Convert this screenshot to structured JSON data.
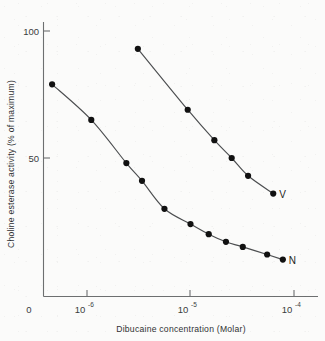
{
  "figure": {
    "background_color": "#fbfbfa",
    "ink_color": "#3a3c3e",
    "marker_color": "#111111"
  },
  "chart_data": {
    "type": "line",
    "title": "",
    "subtitle": "",
    "xlabel": "Dibucaine concentration (Molar)",
    "ylabel": "Choline esterase activity (% of maximum)",
    "x_scale": "log",
    "x_axis_origin_label": "0",
    "x_tick_labels": [
      "10⁻⁶",
      "10⁻⁵",
      "10⁻⁴"
    ],
    "x_tick_bases": [
      "10",
      "10",
      "10"
    ],
    "x_tick_exponents": [
      "-6",
      "-5",
      "-4"
    ],
    "x_tick_values": [
      1e-06,
      1e-05,
      0.0001
    ],
    "xlim": [
      3e-07,
      0.00011
    ],
    "y_tick_labels": [
      "50",
      "100"
    ],
    "y_tick_values": [
      50,
      100
    ],
    "ylim": [
      0,
      108
    ],
    "grid": false,
    "legend_position": "inline-at-curve-end",
    "annotations": [
      {
        "text": "V",
        "series": "V",
        "position": "right-end-of-upper-curve"
      },
      {
        "text": "N",
        "series": "N",
        "position": "right-end-of-lower-curve"
      }
    ],
    "series": [
      {
        "name": "V",
        "label": "V",
        "marker": "filled-circle",
        "color": "#111111",
        "x": [
          3.1e-06,
          9.4e-06,
          1.7e-05,
          2.5e-05,
          3.6e-05,
          6.3e-05
        ],
        "y": [
          93,
          69,
          57,
          50,
          43,
          36
        ]
      },
      {
        "name": "N",
        "label": "N",
        "marker": "filled-circle",
        "color": "#111111",
        "x": [
          4.6e-07,
          1.1e-06,
          2.4e-06,
          3.4e-06,
          5.6e-06,
          1e-05,
          1.5e-05,
          2.2e-05,
          3.2e-05,
          5.5e-05,
          7.8e-05
        ],
        "y": [
          79,
          65,
          48,
          41,
          30,
          24,
          20,
          17,
          15,
          12,
          10
        ]
      }
    ]
  }
}
